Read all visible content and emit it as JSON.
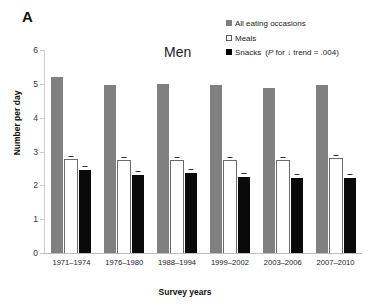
{
  "panel": {
    "letter": "A"
  },
  "chart_data": {
    "type": "bar",
    "title": "Men",
    "xlabel": "Survey years",
    "ylabel": "Number per day",
    "ylim": [
      0,
      6
    ],
    "yticks": [
      0,
      1,
      2,
      3,
      4,
      5,
      6
    ],
    "grid": false,
    "legend_position": "top-right",
    "categories": [
      "1971–1974",
      "1976–1980",
      "1988–1994",
      "1999–2002",
      "2003–2006",
      "2007–2010"
    ],
    "series": [
      {
        "name": "All eating occasions",
        "color": "#808080",
        "values": [
          5.2,
          4.97,
          5.0,
          4.97,
          4.88,
          4.98
        ]
      },
      {
        "name": "Meals",
        "color": "#ffffff",
        "values": [
          2.75,
          2.72,
          2.72,
          2.73,
          2.72,
          2.78
        ]
      },
      {
        "name": "Snacks",
        "color": "#000000",
        "values": [
          2.45,
          2.3,
          2.37,
          2.25,
          2.23,
          2.21
        ]
      }
    ],
    "annotations": [
      {
        "text": "(P for ↓ trend = .004)",
        "attached_to": "Snacks"
      }
    ]
  },
  "legend": {
    "items": [
      {
        "label": "All eating occasions",
        "note": ""
      },
      {
        "label": "Meals",
        "note": ""
      },
      {
        "label": "Snacks",
        "note_prefix": "(",
        "note_italic": "P",
        "note_rest": " for ↓ trend = .004)"
      }
    ]
  }
}
